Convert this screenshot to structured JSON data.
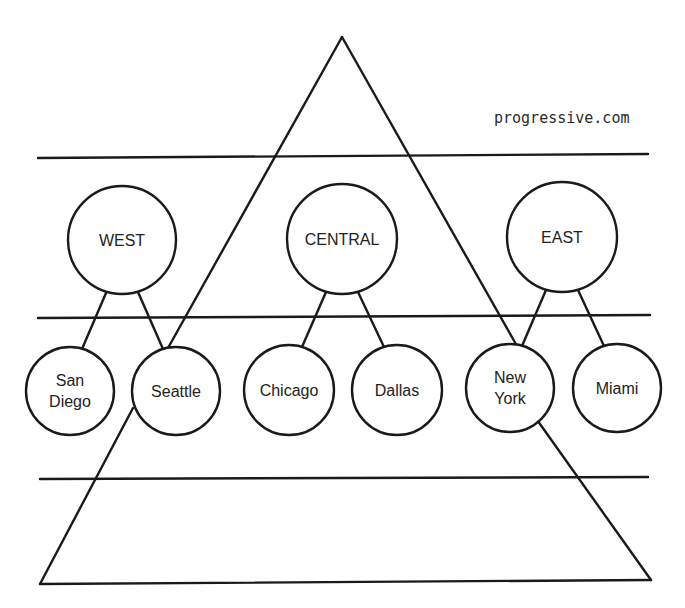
{
  "diagram": {
    "type": "hierarchy-pyramid",
    "watermark": "progressive.com",
    "colors": {
      "stroke": "#1a1a1a",
      "text": "#222222",
      "background": "#ffffff"
    },
    "pyramid": {
      "apex": [
        342,
        37
      ],
      "base_left": [
        40,
        584
      ],
      "base_right": [
        651,
        580
      ]
    },
    "divider_lines": [
      {
        "y_left": 158,
        "y_right": 154,
        "x1": 38,
        "x2": 648
      },
      {
        "y_left": 318,
        "y_right": 315,
        "x1": 38,
        "x2": 650
      },
      {
        "y_left": 479,
        "y_right": 477,
        "x1": 40,
        "x2": 648
      }
    ],
    "regions": [
      {
        "label": "WEST",
        "cx": 122,
        "cy": 240,
        "r": 54,
        "children": [
          {
            "label_lines": [
              "San",
              "Diego"
            ],
            "cx": 70,
            "cy": 391,
            "r": 44
          },
          {
            "label_lines": [
              "Seattle"
            ],
            "cx": 176,
            "cy": 391,
            "r": 44
          }
        ]
      },
      {
        "label": "CENTRAL",
        "cx": 342,
        "cy": 239,
        "r": 55,
        "children": [
          {
            "label_lines": [
              "Chicago"
            ],
            "cx": 289,
            "cy": 390,
            "r": 45
          },
          {
            "label_lines": [
              "Dallas"
            ],
            "cx": 397,
            "cy": 390,
            "r": 45
          }
        ]
      },
      {
        "label": "EAST",
        "cx": 562,
        "cy": 237,
        "r": 55,
        "children": [
          {
            "label_lines": [
              "New",
              "York"
            ],
            "cx": 510,
            "cy": 388,
            "r": 44
          },
          {
            "label_lines": [
              "Miami"
            ],
            "cx": 617,
            "cy": 388,
            "r": 44
          }
        ]
      }
    ]
  },
  "labels": {
    "west": "WEST",
    "central": "CENTRAL",
    "east": "EAST",
    "san_diego_1": "San",
    "san_diego_2": "Diego",
    "seattle": "Seattle",
    "chicago": "Chicago",
    "dallas": "Dallas",
    "new_york_1": "New",
    "new_york_2": "York",
    "miami": "Miami",
    "watermark": "progressive.com"
  }
}
